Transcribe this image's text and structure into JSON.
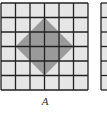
{
  "figures": [
    {
      "label": "A",
      "grid": {
        "rows": 6,
        "cols": 6,
        "cell_fill": "#e6e6e6",
        "line_color": "#222222"
      },
      "shape": {
        "type": "diamond",
        "fill": "#9a9a9a",
        "vertices_grid": [
          [
            3,
            1
          ],
          [
            5,
            3
          ],
          [
            3,
            5
          ],
          [
            1,
            3
          ]
        ]
      }
    },
    {
      "label": "",
      "grid": {
        "rows": 6,
        "cols": 6,
        "cell_fill": "#e6e6e6",
        "line_color": "#222222"
      },
      "partial": true
    }
  ]
}
